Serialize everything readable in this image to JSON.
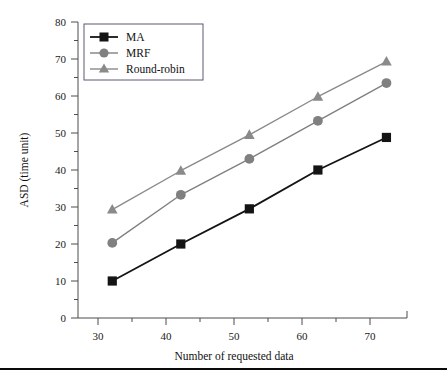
{
  "chart_data": {
    "type": "line",
    "title": "",
    "xlabel": "Number of requested data",
    "ylabel": "ASD (time unit)",
    "x": [
      30,
      40,
      50,
      60,
      70
    ],
    "xlim": [
      25,
      73
    ],
    "ylim": [
      0,
      80
    ],
    "xticks": [
      30,
      40,
      50,
      60,
      70
    ],
    "yticks": [
      0,
      10,
      20,
      30,
      40,
      50,
      60,
      70,
      80
    ],
    "xticklabels": [
      "30",
      "40",
      "50",
      "60",
      "70"
    ],
    "yticklabels": [
      "0",
      "10",
      "20",
      "30",
      "40",
      "50",
      "60",
      "70",
      "80"
    ],
    "grid": false,
    "legend_position": "upper left",
    "series": [
      {
        "name": "MA",
        "values": [
          10,
          20,
          29.5,
          40,
          48.8
        ],
        "color": "#141414",
        "marker": "square",
        "line_width": 1.8
      },
      {
        "name": "MRF",
        "values": [
          20.3,
          33.3,
          43,
          53.3,
          63.5
        ],
        "color": "#808080",
        "marker": "circle",
        "line_width": 1.4
      },
      {
        "name": "Round-robin",
        "values": [
          29.3,
          39.8,
          49.5,
          59.8,
          69.3
        ],
        "color": "#8a8a8a",
        "marker": "triangle",
        "line_width": 1.4
      }
    ]
  },
  "axes": {
    "y_axis_label": "ASD (time unit)",
    "x_axis_label": "Number of requested data",
    "y_tick_0": "0",
    "y_tick_10": "10",
    "y_tick_20": "20",
    "y_tick_30": "30",
    "y_tick_40": "40",
    "y_tick_50": "50",
    "y_tick_60": "60",
    "y_tick_70": "70",
    "y_tick_80": "80",
    "x_tick_30": "30",
    "x_tick_40": "40",
    "x_tick_50": "50",
    "x_tick_60": "60",
    "x_tick_70": "70"
  },
  "legend": {
    "entries": [
      {
        "label": "MA"
      },
      {
        "label": "MRF"
      },
      {
        "label": "Round-robin"
      }
    ]
  }
}
